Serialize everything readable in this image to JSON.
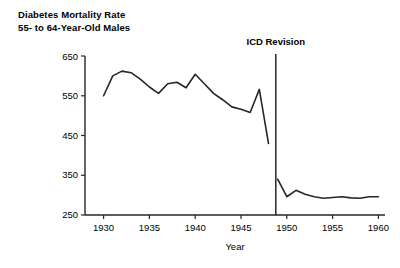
{
  "chart_data": {
    "type": "line",
    "title": "Diabetes Mortality Rate",
    "subtitle": "55- to 64-Year-Old Males",
    "xlabel": "Year",
    "ylabel": "",
    "xlim": [
      1928,
      1961
    ],
    "ylim": [
      250,
      650
    ],
    "grid": false,
    "legend": "none",
    "xticks": [
      1930,
      1935,
      1940,
      1945,
      1950,
      1955,
      1960
    ],
    "xtick_labels": [
      "1930",
      "1935",
      "1940",
      "1945",
      "1950",
      "1955",
      "1960"
    ],
    "yticks": [
      250,
      350,
      450,
      550,
      650
    ],
    "ytick_labels": [
      "250",
      "350",
      "450",
      "550",
      "650"
    ],
    "annotations": [
      {
        "label": "ICD Revision",
        "x": 1948.8,
        "type": "vertical-line",
        "line_top_value": 655,
        "line_bottom_value": 250
      }
    ],
    "series": [
      {
        "name": "Pre-ICD revision",
        "x": [
          1930,
          1931,
          1932,
          1933,
          1934,
          1935,
          1936,
          1937,
          1938,
          1939,
          1940,
          1941,
          1942,
          1943,
          1944,
          1945,
          1946,
          1947,
          1948
        ],
        "values": [
          550,
          600,
          612,
          608,
          592,
          572,
          556,
          580,
          584,
          570,
          604,
          580,
          556,
          540,
          522,
          516,
          508,
          566,
          430
        ]
      },
      {
        "name": "Post-ICD revision",
        "x": [
          1949,
          1950,
          1951,
          1952,
          1953,
          1954,
          1955,
          1956,
          1957,
          1958,
          1959,
          1960
        ],
        "values": [
          340,
          296,
          312,
          302,
          296,
          292,
          294,
          296,
          293,
          292,
          296,
          296
        ]
      }
    ],
    "colors": {
      "line": "#262626",
      "axis": "#262626",
      "text": "#1a1a1a",
      "background": "#ffffff"
    }
  }
}
